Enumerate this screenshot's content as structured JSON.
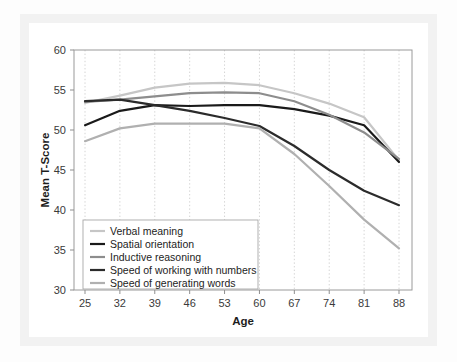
{
  "chart_data": {
    "type": "line",
    "title": "",
    "xlabel": "Age",
    "ylabel": "Mean T-Score",
    "x": [
      25,
      32,
      39,
      46,
      53,
      60,
      67,
      74,
      81,
      88
    ],
    "xticklabels": [
      "25",
      "32",
      "39",
      "46",
      "53",
      "60",
      "67",
      "74",
      "81",
      "88"
    ],
    "yticklabels": [
      "30",
      "35",
      "40",
      "45",
      "50",
      "55",
      "60"
    ],
    "yticks": [
      30,
      35,
      40,
      45,
      50,
      55,
      60
    ],
    "ylim": [
      30,
      60
    ],
    "xlim": [
      25,
      88
    ],
    "grid": "vertical-dotted",
    "legend_position": "lower-left-inside",
    "series": [
      {
        "name": "Verbal meaning",
        "color": "#c6c6c6",
        "width": 2.2,
        "values": [
          53.4,
          54.3,
          55.3,
          55.8,
          55.9,
          55.6,
          54.6,
          53.3,
          51.6,
          46.2
        ]
      },
      {
        "name": "Spatial orientation",
        "color": "#1a1a1a",
        "width": 2.2,
        "values": [
          50.6,
          52.4,
          53.1,
          53.0,
          53.1,
          53.1,
          52.6,
          51.8,
          50.6,
          46.0
        ]
      },
      {
        "name": "Inductive reasoning",
        "color": "#8d8d8d",
        "width": 2.2,
        "values": [
          53.5,
          53.8,
          54.2,
          54.6,
          54.7,
          54.6,
          53.6,
          51.9,
          49.7,
          46.4
        ]
      },
      {
        "name": "Speed of working with numbers",
        "color": "#2b2b2b",
        "width": 2.2,
        "values": [
          53.6,
          53.8,
          53.1,
          52.4,
          51.5,
          50.5,
          48.0,
          45.0,
          42.4,
          40.6
        ]
      },
      {
        "name": "Speed of generating words",
        "color": "#b0b0b0",
        "width": 2.2,
        "values": [
          48.6,
          50.2,
          50.8,
          50.8,
          50.8,
          50.2,
          47.0,
          43.0,
          38.8,
          35.2
        ]
      }
    ]
  },
  "legend": {
    "items": [
      "Verbal meaning",
      "Spatial orientation",
      "Inductive reasoning",
      "Speed of working with numbers",
      "Speed of generating words"
    ]
  }
}
